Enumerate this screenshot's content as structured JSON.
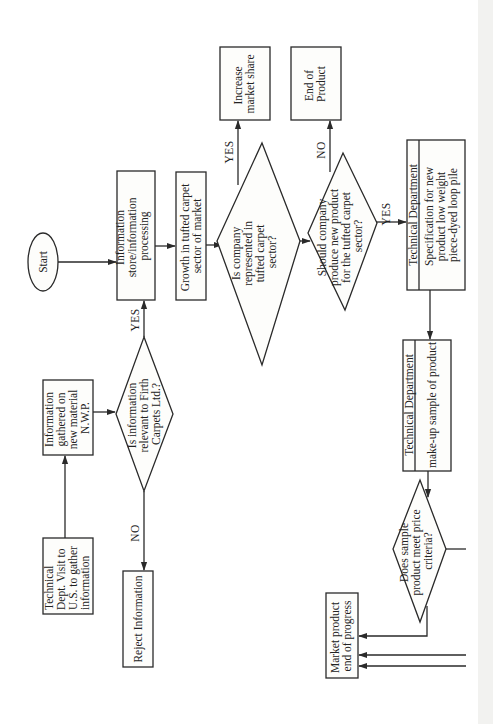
{
  "diagram": {
    "orientation": "rotated-90-ccw",
    "nodes": {
      "start": {
        "type": "terminal",
        "label": "Start"
      },
      "info_store": {
        "type": "process",
        "lines": [
          "Information",
          "store/information",
          "processing"
        ]
      },
      "growth": {
        "type": "process",
        "lines": [
          "Growth in tufted carpet",
          "sector of market"
        ]
      },
      "is_represented": {
        "type": "decision",
        "lines": [
          "Is company",
          "represented in",
          "tufted carpet",
          "sector?"
        ]
      },
      "increase_share": {
        "type": "process",
        "lines": [
          "Increase",
          "market share"
        ]
      },
      "end_of_product": {
        "type": "process",
        "lines": [
          "End of",
          "Product"
        ]
      },
      "should_produce": {
        "type": "decision",
        "lines": [
          "Should company",
          "produce new product",
          "for the tufted carpet",
          "sector?"
        ]
      },
      "tech_spec": {
        "type": "process",
        "header": "Technical Department",
        "lines": [
          "Specification for new",
          "product low weight",
          "piece-dyed loop pile"
        ]
      },
      "tech_sample": {
        "type": "process",
        "header": "Technical Department",
        "lines": [
          "make-up sample of product"
        ]
      },
      "price_criteria": {
        "type": "decision",
        "lines": [
          "Does sample",
          "product meet price",
          "criteria?"
        ]
      },
      "market_product": {
        "type": "process",
        "lines": [
          "Market product",
          "end of progress"
        ]
      },
      "info_gathered": {
        "type": "process",
        "lines": [
          "Information",
          "gathered on",
          "new material",
          "N.W.P."
        ]
      },
      "is_relevant": {
        "type": "decision",
        "lines": [
          "Is information",
          "relevant to Firth",
          "Carpets Ltd.?"
        ]
      },
      "tech_visit": {
        "type": "process",
        "lines": [
          "Technical",
          "Dept. Visit to",
          "U.S. to gather",
          "information"
        ]
      },
      "reject": {
        "type": "process",
        "lines": [
          "Reject Information"
        ]
      }
    },
    "edge_labels": {
      "represented_yes": "YES",
      "should_no": "NO",
      "should_yes": "YES",
      "relevant_yes": "YES",
      "relevant_no": "NO"
    },
    "colors": {
      "background": "#ffffff",
      "stroke": "#2a2a2a",
      "text": "#222222"
    }
  }
}
